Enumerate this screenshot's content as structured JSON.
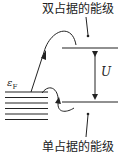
{
  "diagram": {
    "top_label": "双占据的能级",
    "bottom_label": "单占据的能级",
    "fermi_label": "ε",
    "fermi_sub": "F",
    "gap_label": "U",
    "colors": {
      "line": "#222222",
      "background": "#ffffff"
    }
  }
}
